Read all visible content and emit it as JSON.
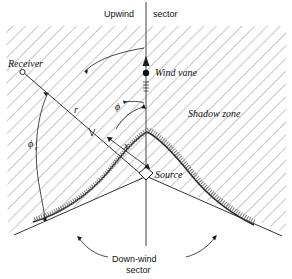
{
  "figure": {
    "stroke_color": "#1a1a1a",
    "hatch_color": "#9a9a9a",
    "labels": {
      "upwind": "Upwind",
      "sector": "sector",
      "receiver": "Receiver",
      "wind_vane": "Wind vane",
      "shadow_zone": "Shadow zone",
      "source": "Source",
      "downwind_line1": "Down-wind",
      "downwind_line2": "sector",
      "radius": "r",
      "phi": "ϕ",
      "phi_c": "ϕ",
      "phi_c_sub": "c",
      "distance_x": "x"
    }
  }
}
